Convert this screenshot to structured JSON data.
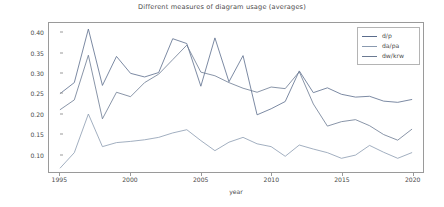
{
  "chart_data": {
    "type": "line",
    "title": "Different measures of diagram usage (averages)",
    "xlabel": "year",
    "ylabel": "",
    "xlim": [
      1994.2,
      2020.8
    ],
    "ylim": [
      0.055,
      0.425
    ],
    "grid": false,
    "legend_position": "upper right",
    "x": [
      1995,
      1996,
      1997,
      1998,
      1999,
      2000,
      2001,
      2002,
      2003,
      2004,
      2005,
      2006,
      2007,
      2008,
      2009,
      2010,
      2011,
      2012,
      2013,
      2014,
      2015,
      2016,
      2017,
      2018,
      2019,
      2020
    ],
    "xticks": [
      1995,
      2000,
      2005,
      2010,
      2015,
      2020
    ],
    "yticks": [
      0.1,
      0.15,
      0.2,
      0.25,
      0.3,
      0.35,
      0.4
    ],
    "ytick_labels": [
      "0.10",
      "0.15",
      "0.20",
      "0.25",
      "0.30",
      "0.35",
      "0.40"
    ],
    "xtick_labels": [
      "1995",
      "2000",
      "2005",
      "2010",
      "2015",
      "2020"
    ],
    "series": [
      {
        "name": "d/p",
        "color": "#5a6c8c",
        "values": [
          0.25,
          0.277,
          0.41,
          0.27,
          0.342,
          0.3,
          0.291,
          0.302,
          0.386,
          0.374,
          0.268,
          0.388,
          0.279,
          0.344,
          0.197,
          0.212,
          0.23,
          0.306,
          0.252,
          0.264,
          0.248,
          0.241,
          0.243,
          0.231,
          0.228,
          0.235
        ]
      },
      {
        "name": "da/pa",
        "color": "#8a9ab0",
        "values": [
          0.065,
          0.103,
          0.199,
          0.118,
          0.128,
          0.131,
          0.135,
          0.141,
          0.152,
          0.16,
          0.133,
          0.108,
          0.129,
          0.141,
          0.125,
          0.118,
          0.094,
          0.122,
          0.112,
          0.103,
          0.089,
          0.097,
          0.121,
          0.104,
          0.089,
          0.103
        ]
      },
      {
        "name": "dw/krw",
        "color": "#6b7a92",
        "values": [
          0.21,
          0.234,
          0.345,
          0.187,
          0.253,
          0.242,
          0.277,
          0.298,
          0.334,
          0.37,
          0.303,
          0.294,
          0.277,
          0.263,
          0.253,
          0.266,
          0.262,
          0.304,
          0.224,
          0.169,
          0.18,
          0.185,
          0.17,
          0.148,
          0.134,
          0.161
        ]
      }
    ]
  },
  "legend": {
    "items": [
      {
        "label": "d/p"
      },
      {
        "label": "da/pa"
      },
      {
        "label": "dw/krw"
      }
    ]
  }
}
